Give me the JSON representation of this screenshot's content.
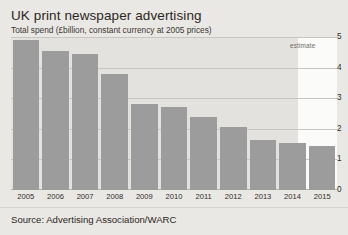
{
  "header": {
    "title": "UK print newspaper advertising",
    "subtitle": "Total spend (£billion, constant currency at 2005 prices)"
  },
  "annotations": {
    "estimate_label": "estimate"
  },
  "footer": {
    "source": "Source: Advertising Association/WARC"
  },
  "colors": {
    "bar": "#9c9c9c",
    "page_background": "#eae8e4",
    "plot_actual_background": "#e4e2de",
    "plot_estimate_background": "#fbfbfa",
    "gridline": "#c9c6c1",
    "text": "#231f20"
  },
  "chart_data": {
    "type": "bar",
    "title": "UK print newspaper advertising",
    "subtitle": "Total spend (£billion, constant currency at 2005 prices)",
    "xlabel": "",
    "ylabel": "£billion (constant 2005 prices)",
    "ylim": [
      0,
      5
    ],
    "yticks": [
      0,
      1,
      2,
      3,
      4,
      5
    ],
    "ytick_labels": [
      "0",
      "1",
      "2",
      "3",
      "4",
      "5"
    ],
    "y_axis_position": "right",
    "grid": true,
    "legend": false,
    "categories": [
      "2005",
      "2006",
      "2007",
      "2008",
      "2009",
      "2010",
      "2011",
      "2012",
      "2013",
      "2014",
      "2015"
    ],
    "values": [
      4.9,
      4.55,
      4.45,
      3.8,
      2.8,
      2.7,
      2.4,
      2.05,
      1.65,
      1.55,
      1.45
    ],
    "annotations": [
      {
        "text": "estimate",
        "applies_to": "2015"
      }
    ],
    "source": "Source: Advertising Association/WARC"
  }
}
